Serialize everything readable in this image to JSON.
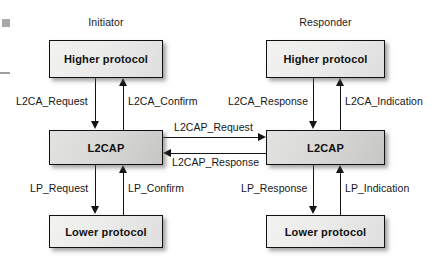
{
  "diagram": {
    "canvas": {
      "width": 441,
      "height": 268,
      "background": "#ffffff"
    },
    "colors": {
      "stroke": "#141414",
      "box_light": "#efefee",
      "box_mid": "#d9d9d7",
      "text": "#161616",
      "artifact": "#a9a9a9"
    }
  },
  "columns": {
    "initiator": {
      "caption": "Initiator"
    },
    "responder": {
      "caption": "Responder"
    }
  },
  "boxes": {
    "initiator": {
      "higher": "Higher protocol",
      "l2cap": "L2CAP",
      "lower": "Lower protocol"
    },
    "responder": {
      "higher": "Higher protocol",
      "l2cap": "L2CAP",
      "lower": "Lower protocol"
    }
  },
  "signals": {
    "initiator_upper_down": "L2CA_Request",
    "initiator_upper_up": "L2CA_Confirm",
    "responder_upper_down": "L2CA_Response",
    "responder_upper_up": "L2CA_Indication",
    "peer_forward": "L2CAP_Request",
    "peer_backward": "L2CAP_Response",
    "initiator_lower_down": "LP_Request",
    "initiator_lower_up": "LP_Confirm",
    "responder_lower_down": "LP_Response",
    "responder_lower_up": "LP_Indication"
  }
}
